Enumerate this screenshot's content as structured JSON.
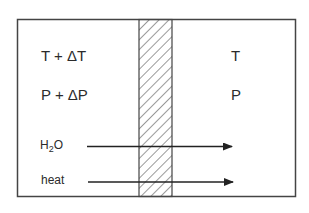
{
  "diagram": {
    "left_chamber": {
      "temperature": "T + ΔT",
      "pressure": "P + ΔP"
    },
    "right_chamber": {
      "temperature": "T",
      "pressure": "P"
    },
    "membrane": {
      "pattern": "diagonal-hatch"
    },
    "flows": [
      {
        "label_main": "H",
        "label_sub": "2",
        "label_tail": "O",
        "direction": "left-to-right"
      },
      {
        "label": "heat",
        "direction": "left-to-right"
      }
    ],
    "colors": {
      "stroke": "#333333",
      "background": "#ffffff"
    }
  }
}
